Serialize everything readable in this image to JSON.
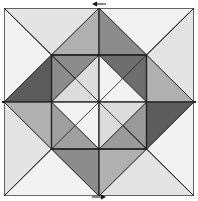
{
  "diagram": {
    "type": "quilt-block",
    "grid_units": 4,
    "colors": {
      "white": "#f4f4f4",
      "very_light": "#e2e2e2",
      "light": "#c8c8c8",
      "medium": "#a4a4a4",
      "medium_dark": "#8a8a8a",
      "dark": "#5e5e5e",
      "outline": "#222222"
    },
    "arrows": [
      {
        "position": "top",
        "direction": "left"
      },
      {
        "position": "bottom",
        "direction": "right"
      }
    ]
  }
}
